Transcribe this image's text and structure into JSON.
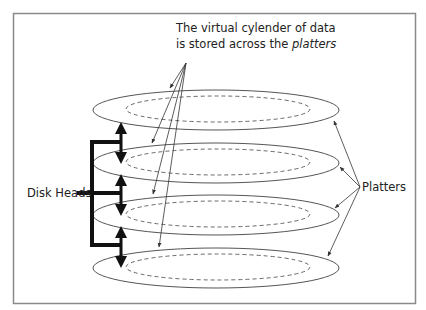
{
  "diagram": {
    "caption": {
      "line1": "The virtual cylender of data",
      "line2_prefix": "is stored across the ",
      "line2_emphasis": "platters"
    },
    "labels": {
      "disk_heads": "Disk Heads",
      "platters": "Platters"
    },
    "platter_count": 4,
    "colors": {
      "frame": "#8a8a8a",
      "outline": "#555555",
      "heads": "#111111"
    }
  }
}
